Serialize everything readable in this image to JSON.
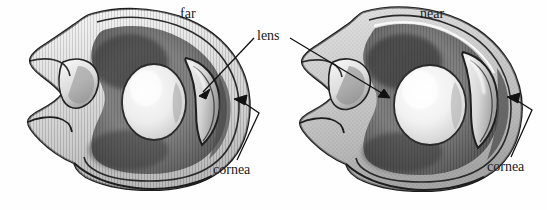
{
  "figure": {
    "kind": "pencil-illustration",
    "background_color": "#fefefe",
    "ink_color": "#1a1a1a"
  },
  "labels": {
    "far": "far",
    "near": "near",
    "lens": "lens",
    "cornea_left": "cornea",
    "cornea_right": "cornea"
  },
  "eyes": [
    {
      "state": "far",
      "lens_shape": "flattened-rounded",
      "label": "far"
    },
    {
      "state": "near",
      "lens_shape": "bulging-rounded",
      "label": "near"
    }
  ],
  "leaders": {
    "lens_to_far_eye": "arrow",
    "lens_to_near_eye": "arrow",
    "cornea_left": "bent-arrow",
    "cornea_right": "bent-arrow"
  },
  "shading": {
    "outer_tone": "#c9c9c9",
    "mid_tone": "#9a9a9a",
    "dark_tone": "#4a4a4a",
    "highlight": "#f2f2f2"
  }
}
